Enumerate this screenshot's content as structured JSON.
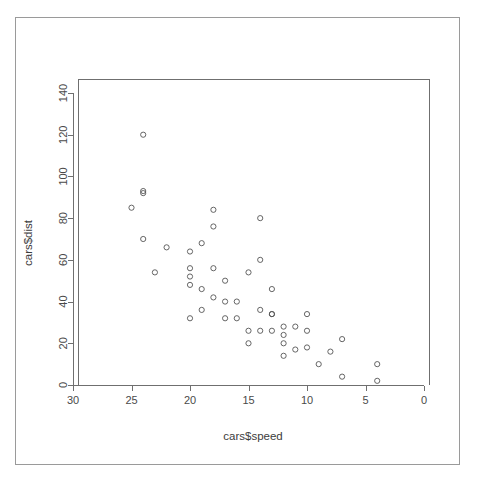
{
  "figure": {
    "kind": "r-base-scatterplot",
    "background_color": "#ffffff",
    "frame_color": "#9a9a9a",
    "axis_color": "#6f6f6f",
    "point_color": "#555555"
  },
  "chart_data": {
    "type": "scatter",
    "title": "",
    "subtitle": "",
    "xlabel": "cars$speed",
    "ylabel": "cars$dist",
    "xlim": [
      30,
      0
    ],
    "ylim": [
      0,
      150
    ],
    "x_axis_reversed": true,
    "grid": false,
    "legend": null,
    "legend_position": "none",
    "xticks": [
      30,
      25,
      20,
      15,
      10,
      5,
      0
    ],
    "xtick_labels": [
      "30",
      "25",
      "20",
      "15",
      "10",
      "5",
      "0"
    ],
    "yticks": [
      0,
      20,
      40,
      60,
      80,
      100,
      120,
      140
    ],
    "ytick_labels": [
      "0",
      "20",
      "40",
      "60",
      "80",
      "100",
      "120",
      "140"
    ],
    "marker": "open-circle",
    "n_points": 50,
    "x": [
      4,
      4,
      7,
      7,
      8,
      9,
      10,
      10,
      10,
      11,
      11,
      12,
      12,
      12,
      12,
      13,
      13,
      13,
      13,
      14,
      14,
      14,
      14,
      15,
      15,
      15,
      16,
      16,
      17,
      17,
      17,
      18,
      18,
      18,
      18,
      19,
      19,
      19,
      20,
      20,
      20,
      20,
      20,
      22,
      23,
      24,
      24,
      24,
      24,
      25
    ],
    "y": [
      2,
      10,
      4,
      22,
      16,
      10,
      18,
      26,
      34,
      17,
      28,
      14,
      20,
      24,
      28,
      26,
      34,
      34,
      46,
      26,
      36,
      60,
      80,
      20,
      26,
      54,
      32,
      40,
      32,
      40,
      50,
      42,
      56,
      76,
      84,
      36,
      46,
      68,
      32,
      48,
      52,
      56,
      64,
      66,
      54,
      70,
      92,
      93,
      120,
      85
    ],
    "points": [
      {
        "speed": 4,
        "dist": 2
      },
      {
        "speed": 4,
        "dist": 10
      },
      {
        "speed": 7,
        "dist": 4
      },
      {
        "speed": 7,
        "dist": 22
      },
      {
        "speed": 8,
        "dist": 16
      },
      {
        "speed": 9,
        "dist": 10
      },
      {
        "speed": 10,
        "dist": 18
      },
      {
        "speed": 10,
        "dist": 26
      },
      {
        "speed": 10,
        "dist": 34
      },
      {
        "speed": 11,
        "dist": 17
      },
      {
        "speed": 11,
        "dist": 28
      },
      {
        "speed": 12,
        "dist": 14
      },
      {
        "speed": 12,
        "dist": 20
      },
      {
        "speed": 12,
        "dist": 24
      },
      {
        "speed": 12,
        "dist": 28
      },
      {
        "speed": 13,
        "dist": 26
      },
      {
        "speed": 13,
        "dist": 34
      },
      {
        "speed": 13,
        "dist": 34
      },
      {
        "speed": 13,
        "dist": 46
      },
      {
        "speed": 14,
        "dist": 26
      },
      {
        "speed": 14,
        "dist": 36
      },
      {
        "speed": 14,
        "dist": 60
      },
      {
        "speed": 14,
        "dist": 80
      },
      {
        "speed": 15,
        "dist": 20
      },
      {
        "speed": 15,
        "dist": 26
      },
      {
        "speed": 15,
        "dist": 54
      },
      {
        "speed": 16,
        "dist": 32
      },
      {
        "speed": 16,
        "dist": 40
      },
      {
        "speed": 17,
        "dist": 32
      },
      {
        "speed": 17,
        "dist": 40
      },
      {
        "speed": 17,
        "dist": 50
      },
      {
        "speed": 18,
        "dist": 42
      },
      {
        "speed": 18,
        "dist": 56
      },
      {
        "speed": 18,
        "dist": 76
      },
      {
        "speed": 18,
        "dist": 84
      },
      {
        "speed": 19,
        "dist": 36
      },
      {
        "speed": 19,
        "dist": 46
      },
      {
        "speed": 19,
        "dist": 68
      },
      {
        "speed": 20,
        "dist": 32
      },
      {
        "speed": 20,
        "dist": 48
      },
      {
        "speed": 20,
        "dist": 52
      },
      {
        "speed": 20,
        "dist": 56
      },
      {
        "speed": 20,
        "dist": 64
      },
      {
        "speed": 22,
        "dist": 66
      },
      {
        "speed": 23,
        "dist": 54
      },
      {
        "speed": 24,
        "dist": 70
      },
      {
        "speed": 24,
        "dist": 92
      },
      {
        "speed": 24,
        "dist": 93
      },
      {
        "speed": 24,
        "dist": 120
      },
      {
        "speed": 25,
        "dist": 85
      }
    ]
  },
  "geometry": {
    "plot_left": 78,
    "plot_right": 429,
    "plot_top": 79,
    "plot_bottom": 385,
    "x_pixel_at_30": 73,
    "x_pixel_at_0": 424,
    "y_pixel_at_0": 385,
    "y_pixel_at_140": 93
  }
}
